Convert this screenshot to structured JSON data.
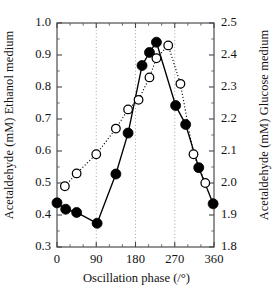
{
  "chart_data": {
    "type": "line",
    "title": "",
    "xlabel": "Oscillation phase (/°)",
    "xlim": [
      0,
      360
    ],
    "xticks": [
      0,
      90,
      180,
      270,
      360
    ],
    "xtick_labels": [
      "0",
      "90",
      "180",
      "270",
      "360"
    ],
    "x_minor_tick_step": 30,
    "grid": "vertical dotted gridlines at 90, 180, 270",
    "legend": "none",
    "axes": [
      {
        "side": "left",
        "label": "Acetaldehyde (mM)  Ethanol medium",
        "label_part_1": "Acetaldehyde (mM)",
        "label_part_2": "Ethanol medium",
        "ylim": [
          0.3,
          1.0
        ],
        "yticks": [
          0.3,
          0.4,
          0.5,
          0.6,
          0.7,
          0.8,
          0.9,
          1.0
        ],
        "ytick_labels": [
          "0.3",
          "0.4",
          "0.5",
          "0.6",
          "0.7",
          "0.8",
          "0.9",
          "1.0"
        ]
      },
      {
        "side": "right",
        "label": "Acetaldehyde  (mM) Glucose medium",
        "label_part_1": "Acetaldehyde",
        "label_part_2": "(mM) Glucose medium",
        "ylim": [
          1.8,
          2.5
        ],
        "yticks": [
          1.8,
          1.9,
          2.0,
          2.1,
          2.2,
          2.3,
          2.4,
          2.5
        ],
        "ytick_labels": [
          "1.8",
          "1.9",
          "2.0",
          "2.1",
          "2.2",
          "2.3",
          "2.4",
          "2.5"
        ]
      }
    ],
    "series": [
      {
        "name": "Ethanol medium",
        "axis": "left",
        "marker": "filled-circle",
        "marker_color": "#000000",
        "line_style": "solid",
        "line_color": "#000000",
        "x": [
          0,
          20,
          45,
          92,
          135,
          163,
          195,
          212,
          228,
          272,
          295,
          325,
          358
        ],
        "y": [
          0.438,
          0.418,
          0.408,
          0.374,
          0.528,
          0.656,
          0.867,
          0.908,
          0.94,
          0.742,
          0.683,
          0.548,
          0.435
        ]
      },
      {
        "name": "Glucose medium",
        "axis": "right",
        "marker": "open-circle",
        "marker_color": "#ffffff",
        "marker_edge_color": "#000000",
        "line_style": "dotted",
        "line_color": "#000000",
        "x": [
          18,
          45,
          90,
          135,
          163,
          187,
          212,
          228,
          255,
          283,
          313,
          340
        ],
        "y": [
          1.99,
          2.03,
          2.09,
          2.17,
          2.23,
          2.26,
          2.33,
          2.39,
          2.43,
          2.31,
          2.09,
          2.0
        ]
      }
    ]
  },
  "plot_geometry": {
    "left": 57,
    "right": 214,
    "top": 23,
    "bottom": 247
  }
}
